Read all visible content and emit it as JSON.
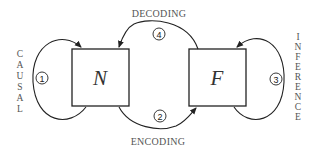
{
  "diagram": {
    "nodes": [
      {
        "id": "N",
        "label": "N"
      },
      {
        "id": "F",
        "label": "F"
      }
    ],
    "edges": [
      {
        "number": "1",
        "label": "CAUSAL",
        "from": "N",
        "to": "N"
      },
      {
        "number": "2",
        "label": "ENCODING",
        "from": "N",
        "to": "F"
      },
      {
        "number": "3",
        "label": "INFERENCE",
        "from": "F",
        "to": "F"
      },
      {
        "number": "4",
        "label": "DECODING",
        "from": "F",
        "to": "N"
      }
    ],
    "vertical_left": [
      "C",
      "A",
      "U",
      "S",
      "A",
      "L"
    ],
    "vertical_right": [
      "I",
      "N",
      "F",
      "E",
      "R",
      "E",
      "N",
      "C",
      "E"
    ]
  }
}
